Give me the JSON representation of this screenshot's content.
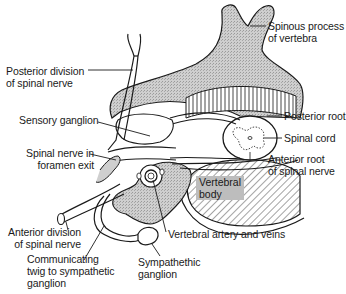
{
  "diagram": {
    "type": "anatomical-cross-section",
    "labels": [
      {
        "id": "spinous_process",
        "line1": "Spinous process",
        "line2": "of vertebra"
      },
      {
        "id": "posterior_division",
        "line1": "Posterior division",
        "line2": "of spinal nerve"
      },
      {
        "id": "sensory_ganglion",
        "line1": "Sensory ganglion"
      },
      {
        "id": "posterior_root",
        "line1": "Posterior root"
      },
      {
        "id": "spinal_cord",
        "line1": "Spinal cord"
      },
      {
        "id": "spinal_nerve_foramen",
        "line1": "Spinal nerve in",
        "line2": "foramen exit"
      },
      {
        "id": "anterior_root",
        "line1": "Anterior root",
        "line2": "of spinal nerve"
      },
      {
        "id": "vertebral_body",
        "line1": "Vertebral",
        "line2": "body"
      },
      {
        "id": "anterior_division",
        "line1": "Anterior division",
        "line2": "of spinal nerve"
      },
      {
        "id": "vertebral_artery",
        "line1": "Vertebral artery and veins"
      },
      {
        "id": "communicating_twig",
        "line1": "Communicating",
        "line2": "twig to sympathetic",
        "line3": "ganglion"
      },
      {
        "id": "sympathetic_ganglion",
        "line1": "Sympathethic",
        "line2": "ganglion"
      }
    ],
    "colors": {
      "bone_fill": "#c8c8c8",
      "line": "#1a1a1a",
      "background": "#ffffff",
      "label_box": "#bdbdbd"
    }
  }
}
